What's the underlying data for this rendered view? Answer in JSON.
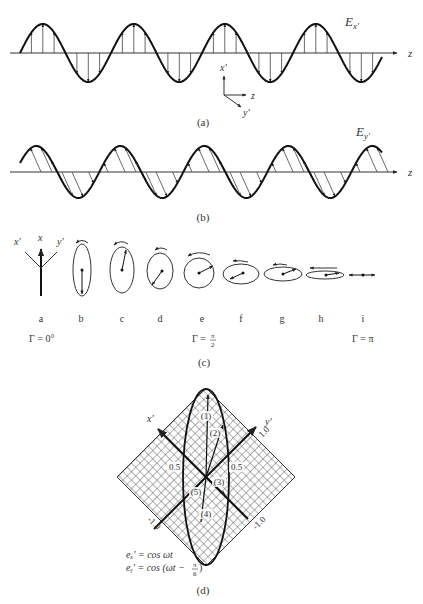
{
  "panel_a": {
    "caption": "(a)",
    "field_label": "E",
    "field_sub": "x'",
    "axis_label": "z",
    "triad": {
      "up": "x'",
      "right": "z",
      "diag": "y'"
    }
  },
  "panel_b": {
    "caption": "(b)",
    "field_label": "E",
    "field_sub": "y'",
    "axis_label": "z"
  },
  "panel_c": {
    "caption": "(c)",
    "axes_labels": {
      "left": "x'",
      "mid": "x",
      "right": "y'"
    },
    "states": [
      {
        "id": "a",
        "label": "a"
      },
      {
        "id": "b",
        "label": "b"
      },
      {
        "id": "c",
        "label": "c"
      },
      {
        "id": "d",
        "label": "d"
      },
      {
        "id": "e",
        "label": "e"
      },
      {
        "id": "f",
        "label": "f"
      },
      {
        "id": "g",
        "label": "g"
      },
      {
        "id": "h",
        "label": "h"
      },
      {
        "id": "i",
        "label": "i"
      }
    ],
    "gamma_labels": {
      "start": "Γ = 0°",
      "mid_prefix": "Γ = ",
      "mid_num": "π",
      "mid_den": "2",
      "end": "Γ = π"
    }
  },
  "panel_d": {
    "caption": "(d)",
    "axis_x": "x'",
    "axis_y": "y'",
    "tick_left_half": "0.5",
    "tick_right_half": "0.5",
    "tick_top_right": "1.0",
    "tick_bottom_left": "-1.0",
    "tick_bottom_right": "-1.0",
    "points": [
      "(1)",
      "(2)",
      "(3)",
      "(4)",
      "(5)"
    ],
    "eq1": "eₓ' = cos ωt",
    "eq2_prefix": "eᵧ' = cos (ωt − ",
    "eq2_num": "π",
    "eq2_den": "6",
    "eq2_suffix": " )"
  }
}
